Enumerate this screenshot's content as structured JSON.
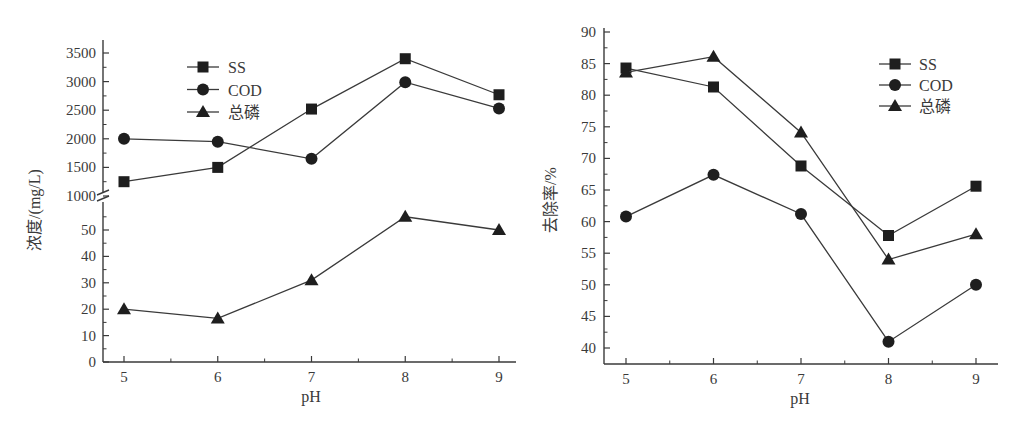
{
  "chart_data": [
    {
      "type": "line",
      "title": "",
      "xlabel": "pH",
      "ylabel": "浓度/(mg/L)",
      "x": [
        5,
        6,
        7,
        8,
        9
      ],
      "axis_break": {
        "upper_range": [
          1000,
          3500
        ],
        "lower_range": [
          0,
          55
        ]
      },
      "yticks_upper": [
        1000,
        1500,
        2000,
        2500,
        3000,
        3500
      ],
      "yticks_lower": [
        0,
        10,
        20,
        30,
        40,
        50
      ],
      "xticks": [
        5,
        6,
        7,
        8,
        9
      ],
      "legend_position": "upper-left-inside",
      "series": [
        {
          "name": "SS",
          "marker": "square",
          "values": [
            1250,
            1500,
            2520,
            3400,
            2770
          ]
        },
        {
          "name": "COD",
          "marker": "circle",
          "values": [
            2000,
            1950,
            1650,
            2990,
            2530
          ]
        },
        {
          "name": "总磷",
          "marker": "triangle",
          "values": [
            20,
            16.5,
            31,
            55,
            50
          ]
        }
      ]
    },
    {
      "type": "line",
      "title": "",
      "xlabel": "pH",
      "ylabel": "去除率/%",
      "x": [
        5,
        6,
        7,
        8,
        9
      ],
      "ylim": [
        38,
        90
      ],
      "yticks": [
        40,
        45,
        50,
        55,
        60,
        65,
        70,
        75,
        80,
        85,
        90
      ],
      "xticks": [
        5,
        6,
        7,
        8,
        9
      ],
      "legend_position": "upper-right-inside",
      "series": [
        {
          "name": "SS",
          "marker": "square",
          "values": [
            84.3,
            81.3,
            68.8,
            57.8,
            65.6
          ]
        },
        {
          "name": "COD",
          "marker": "circle",
          "values": [
            60.8,
            67.4,
            61.2,
            41.0,
            50.0
          ]
        },
        {
          "name": "总磷",
          "marker": "triangle",
          "values": [
            83.6,
            86.1,
            74.1,
            54.0,
            58.0
          ]
        }
      ]
    }
  ],
  "left": {
    "ylabel": "浓度/(mg/L)",
    "xlabel": "pH",
    "legend": [
      "SS",
      "COD",
      "总磷"
    ]
  },
  "right": {
    "ylabel": "去除率/%",
    "xlabel": "pH",
    "legend": [
      "SS",
      "COD",
      "总磷"
    ]
  },
  "colors": {
    "line": "#3a3a3a",
    "marker": "#1e1e1e"
  }
}
